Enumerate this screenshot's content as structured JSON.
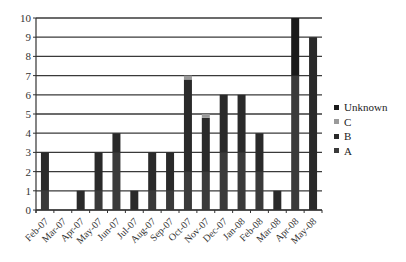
{
  "chart_data": {
    "type": "bar",
    "stacked": true,
    "title": "",
    "xlabel": "",
    "ylabel": "",
    "ylim": [
      0,
      10
    ],
    "yticks": [
      0,
      1,
      2,
      3,
      4,
      5,
      6,
      7,
      8,
      9,
      10
    ],
    "grid": true,
    "legend_position": "right",
    "categories": [
      "Feb-07",
      "Mar-07",
      "Apr-07",
      "May-07",
      "Jun-07",
      "Jul-07",
      "Aug-07",
      "Sep-07",
      "Oct-07",
      "Nov-07",
      "Dec-07",
      "Jan-08",
      "Feb-08",
      "Mar-08",
      "Apr-08",
      "May-08"
    ],
    "series": [
      {
        "name": "A",
        "color": "#3a3a3a",
        "values": [
          1,
          0,
          0,
          1,
          3,
          0,
          1,
          1,
          2,
          2,
          3,
          3,
          2,
          0,
          7,
          0
        ]
      },
      {
        "name": "B",
        "color": "#2a2a2a",
        "values": [
          2,
          0,
          1,
          2,
          1,
          1,
          2,
          2,
          4.8,
          2.8,
          3,
          3,
          2,
          1,
          0,
          9
        ]
      },
      {
        "name": "C",
        "color": "#9a9a9a",
        "values": [
          0,
          0,
          0,
          0,
          0,
          0,
          0,
          0,
          0.2,
          0.2,
          0,
          0,
          0,
          0,
          0,
          0
        ]
      },
      {
        "name": "Unknown",
        "color": "#1a1a1a",
        "values": [
          0,
          0,
          0,
          0,
          0,
          0,
          0,
          0,
          0,
          0,
          0,
          0,
          0,
          0,
          3,
          0
        ]
      }
    ],
    "totals": [
      3,
      0,
      1,
      3,
      4,
      1,
      3,
      3,
      7,
      5,
      6,
      6,
      4,
      1,
      10,
      9
    ]
  },
  "legend": {
    "items": [
      {
        "label": "Unknown",
        "color": "#1a1a1a"
      },
      {
        "label": "C",
        "color": "#9a9a9a"
      },
      {
        "label": "B",
        "color": "#2a2a2a"
      },
      {
        "label": "A",
        "color": "#3a3a3a"
      }
    ]
  }
}
